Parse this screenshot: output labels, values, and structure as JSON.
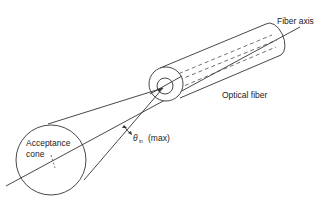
{
  "diagram": {
    "type": "optical-fiber-acceptance-cone",
    "labels": {
      "fiber_axis": "Fiber axis",
      "optical_fiber": "Optical fiber",
      "theta_symbol": "θ",
      "theta_subscript": "in",
      "theta_suffix": "(max)",
      "acceptance_line1": "Acceptance",
      "acceptance_line2": "cone"
    },
    "colors": {
      "stroke": "#333333",
      "background": "#ffffff"
    }
  }
}
